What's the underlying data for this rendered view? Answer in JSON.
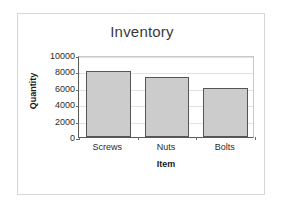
{
  "chart_data": {
    "type": "bar",
    "title": "Inventory",
    "xlabel": "Item",
    "ylabel": "Quantity",
    "categories": [
      "Screws",
      "Nuts",
      "Bolts"
    ],
    "values": [
      8000,
      7300,
      6000
    ],
    "ylim": [
      0,
      10000
    ],
    "yticks": [
      0,
      2000,
      4000,
      6000,
      8000,
      10000
    ],
    "ytick_labels": [
      "0",
      "2000",
      "4000",
      "6000",
      "8000",
      "10000"
    ],
    "grid": true,
    "legend": false,
    "legend_position": "none",
    "series": [
      {
        "name": "Quantity",
        "values": [
          8000,
          7300,
          6000
        ]
      }
    ]
  },
  "style": {
    "bar_fill": "#cccccc",
    "bar_stroke": "#555555",
    "gridline_color": "#e2e2e2",
    "axis_color": "#5a5a5a",
    "frame_color": "#d6d6d6",
    "background": "#ffffff",
    "title_color": "#3a3a3a",
    "label_color": "#2b2b2b"
  }
}
